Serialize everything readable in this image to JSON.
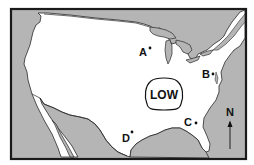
{
  "map": {
    "title": "",
    "region": "Continental United States",
    "colors": {
      "water": "#b5b5b5",
      "land": "#ffffff",
      "outline": "#2a2a2a",
      "frame": "#1a1a1a"
    },
    "pressure_system": {
      "label": "LOW",
      "x": 164,
      "y": 94
    },
    "locations": [
      {
        "id": "A",
        "label": "A",
        "x": 143,
        "y": 45
      },
      {
        "id": "B",
        "label": "B",
        "x": 211,
        "y": 74
      },
      {
        "id": "C",
        "label": "C",
        "x": 196,
        "y": 122
      },
      {
        "id": "D",
        "label": "D",
        "x": 131,
        "y": 133
      }
    ],
    "compass": {
      "label": "N",
      "arrow": "north-arrow-icon"
    }
  }
}
